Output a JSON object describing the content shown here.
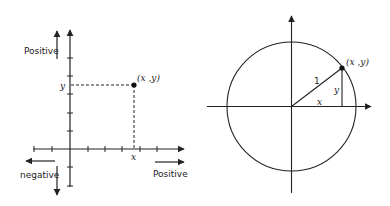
{
  "diagrams": {
    "cartesian": {
      "title": "Cartesian coordinate plane",
      "point_label": "(x ,y)",
      "x_label": "x",
      "y_label": "y",
      "positive_y_label": "Positive",
      "positive_x_label": "Positive",
      "negative_label": "negative"
    },
    "unit_circle": {
      "title": "Unit circle",
      "point_label": "(x ,y)",
      "radius_label": "1",
      "x_label": "x",
      "y_label": "y"
    }
  },
  "colors": {
    "stroke": "#222222",
    "background": "#ffffff"
  }
}
